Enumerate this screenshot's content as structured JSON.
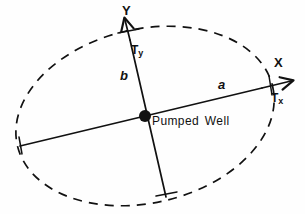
{
  "figure": {
    "background_color": "#fefefe",
    "ink_color": "#111111",
    "labels": {
      "axis_x": "X",
      "axis_y": "Y",
      "tensor_x_base": "T",
      "tensor_x_sub": "x",
      "tensor_y_base": "T",
      "tensor_y_sub": "y",
      "semi_major": "a",
      "semi_minor": "b",
      "well": "Pumped Well"
    },
    "icons": {
      "pumped_well": "filled-circle-icon",
      "x_axis_arrow": "arrow-right-icon",
      "y_axis_arrow": "arrow-up-icon",
      "tick_x": "tick-mark-icon",
      "tick_y": "tick-mark-icon"
    },
    "geometry": {
      "center_x": 145,
      "center_y": 116,
      "well_dot_radius": 6,
      "ellipse_semi_major": 131,
      "ellipse_semi_minor": 87,
      "ellipse_rotation_deg": -13,
      "ellipse_dash_pattern": "9 7",
      "ellipse_stroke_width": 1.6,
      "major_axis_left_x": 20,
      "major_axis_left_y": 146,
      "major_axis_arrow_x": 291,
      "major_axis_arrow_y": 83,
      "minor_axis_bottom_x": 166,
      "minor_axis_bottom_y": 197,
      "minor_axis_arrow_x": 124,
      "minor_axis_arrow_y": 18,
      "tick_x_at": [
        270,
        85
      ],
      "tick_y_at": [
        128,
        31
      ]
    }
  }
}
